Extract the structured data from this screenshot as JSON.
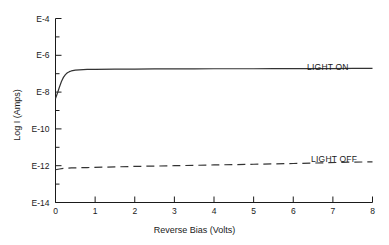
{
  "chart_data": {
    "type": "line",
    "title": "",
    "subtitle": "",
    "xlabel": "Reverse Bias (Volts)",
    "ylabel": "Log I (Amps)",
    "xlim": [
      0,
      8
    ],
    "ylim": [
      -14,
      -4
    ],
    "grid": false,
    "legend_position": "inline-right",
    "x_ticks": [
      {
        "value": 0,
        "label": "0"
      },
      {
        "value": 1,
        "label": "1"
      },
      {
        "value": 2,
        "label": "2"
      },
      {
        "value": 3,
        "label": "3"
      },
      {
        "value": 4,
        "label": "4"
      },
      {
        "value": 5,
        "label": "5"
      },
      {
        "value": 6,
        "label": "6"
      },
      {
        "value": 7,
        "label": "7"
      },
      {
        "value": 8,
        "label": "8"
      }
    ],
    "y_ticks": [
      {
        "value": -4,
        "label": "E-4",
        "major": true
      },
      {
        "value": -5,
        "label": "",
        "major": false
      },
      {
        "value": -6,
        "label": "E-6",
        "major": true
      },
      {
        "value": -7,
        "label": "",
        "major": false
      },
      {
        "value": -8,
        "label": "E-8",
        "major": true
      },
      {
        "value": -9,
        "label": "",
        "major": false
      },
      {
        "value": -10,
        "label": "E-10",
        "major": true
      },
      {
        "value": -11,
        "label": "",
        "major": false
      },
      {
        "value": -12,
        "label": "E-12",
        "major": true
      },
      {
        "value": -13,
        "label": "",
        "major": false
      },
      {
        "value": -14,
        "label": "E-14",
        "major": true
      }
    ],
    "series": [
      {
        "name": "LIGHT ON",
        "style": "solid",
        "color": "#333333",
        "label_text": "LIGHT ON",
        "x": [
          0,
          0.05,
          0.1,
          0.15,
          0.2,
          0.25,
          0.3,
          0.35,
          0.4,
          0.5,
          0.6,
          0.8,
          1.0,
          1.5,
          2.0,
          2.5,
          3.0,
          3.5,
          4.0,
          4.5,
          5.0,
          5.5,
          6.0,
          6.5,
          7.0,
          7.5,
          8.0
        ],
        "y": [
          -8.35,
          -8.05,
          -7.72,
          -7.42,
          -7.2,
          -7.05,
          -6.95,
          -6.89,
          -6.85,
          -6.81,
          -6.79,
          -6.77,
          -6.76,
          -6.75,
          -6.75,
          -6.74,
          -6.74,
          -6.74,
          -6.73,
          -6.73,
          -6.73,
          -6.72,
          -6.72,
          -6.72,
          -6.72,
          -6.71,
          -6.71
        ]
      },
      {
        "name": "LIGHT OFF",
        "style": "dashed",
        "color": "#333333",
        "label_text": "LIGHT OFF",
        "x": [
          0,
          0.1,
          0.2,
          0.4,
          0.8,
          1.2,
          2.0,
          3.0,
          4.0,
          5.0,
          6.0,
          6.8,
          7.4,
          8.0
        ],
        "y": [
          -12.22,
          -12.18,
          -12.15,
          -12.12,
          -12.1,
          -12.08,
          -12.04,
          -12.0,
          -11.96,
          -11.92,
          -11.88,
          -11.84,
          -11.81,
          -11.79
        ]
      }
    ],
    "annotations": [
      {
        "text": "LIGHT ON",
        "x": 6.35,
        "y": -6.35
      },
      {
        "text": "LIGHT OFF",
        "x": 6.45,
        "y": -11.35
      }
    ]
  },
  "colors": {
    "axis": "#1a1a1a",
    "curve": "#333333",
    "background": "#ffffff"
  }
}
